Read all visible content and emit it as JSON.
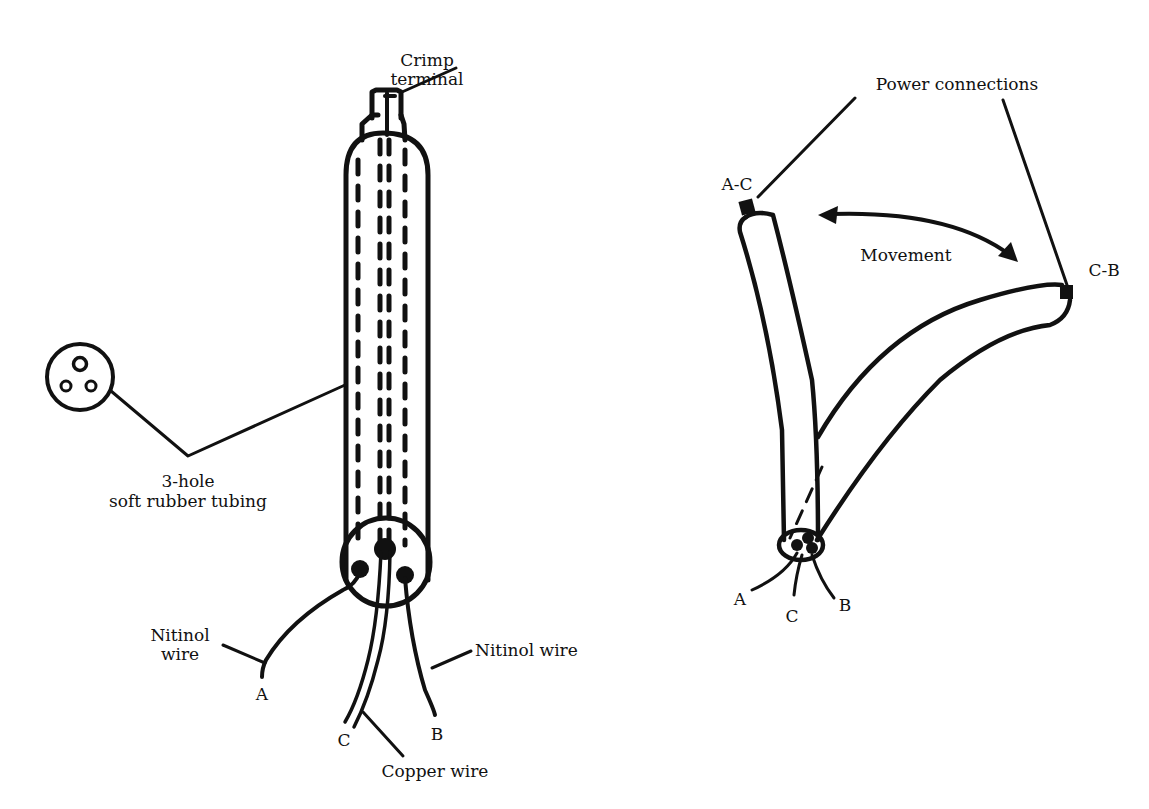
{
  "left_diagram": {
    "labels": {
      "crimp_terminal_line1": "Crimp",
      "crimp_terminal_line2": "terminal",
      "tubing_line1": "3-hole",
      "tubing_line2": "soft rubber tubing",
      "nitinol_left_line1": "Nitinol",
      "nitinol_left_line2": "wire",
      "nitinol_right": "Nitinol wire",
      "copper_wire": "Copper wire",
      "wire_a": "A",
      "wire_b": "B",
      "wire_c": "C"
    }
  },
  "right_diagram": {
    "labels": {
      "power_connections": "Power connections",
      "conn_ac": "A-C",
      "conn_cb": "C-B",
      "movement": "Movement",
      "wire_a": "A",
      "wire_b": "B",
      "wire_c": "C"
    }
  }
}
